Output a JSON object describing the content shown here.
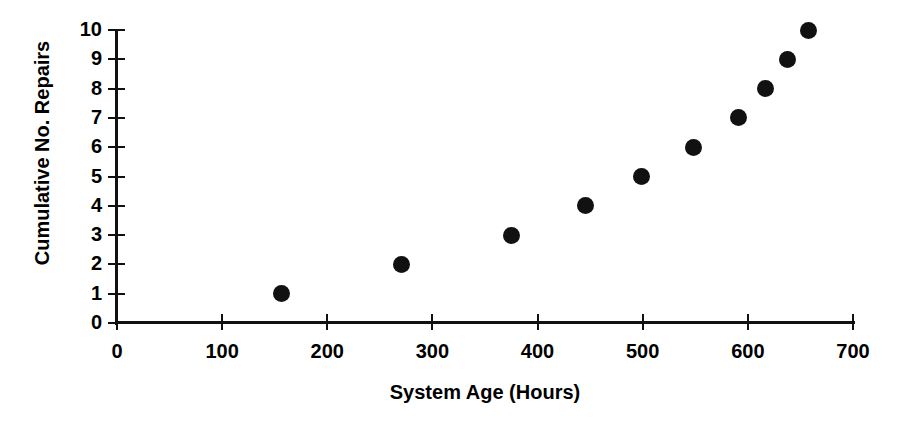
{
  "chart_data": {
    "type": "scatter",
    "title": "",
    "xlabel": "System Age (Hours)",
    "ylabel": "Cumulative No. Repairs",
    "xlim": [
      0,
      700
    ],
    "ylim": [
      0,
      10
    ],
    "xticks": [
      0,
      100,
      200,
      300,
      400,
      500,
      600,
      700
    ],
    "xtick_labels": [
      "0",
      "100",
      "200",
      "300",
      "400",
      "500",
      "600",
      "700"
    ],
    "yticks": [
      0,
      1,
      2,
      3,
      4,
      5,
      6,
      7,
      8,
      9,
      10
    ],
    "ytick_labels": [
      "0",
      "1",
      "2",
      "3",
      "4",
      "5",
      "6",
      "7",
      "8",
      "9",
      "10"
    ],
    "grid": false,
    "legend": false,
    "marker_color": "#111111",
    "marker_shape": "filled-circle",
    "series": [
      {
        "name": "Cumulative repairs",
        "x": [
          156,
          271,
          375,
          446,
          499,
          548,
          591,
          617,
          638,
          658
        ],
        "y": [
          1,
          2,
          3,
          4,
          5,
          6,
          7,
          8,
          9,
          10
        ]
      }
    ],
    "points": [
      {
        "x": 156,
        "y": 1
      },
      {
        "x": 271,
        "y": 2
      },
      {
        "x": 375,
        "y": 3
      },
      {
        "x": 446,
        "y": 4
      },
      {
        "x": 499,
        "y": 5
      },
      {
        "x": 548,
        "y": 6
      },
      {
        "x": 591,
        "y": 7
      },
      {
        "x": 617,
        "y": 8
      },
      {
        "x": 638,
        "y": 9
      },
      {
        "x": 658,
        "y": 10
      }
    ]
  }
}
